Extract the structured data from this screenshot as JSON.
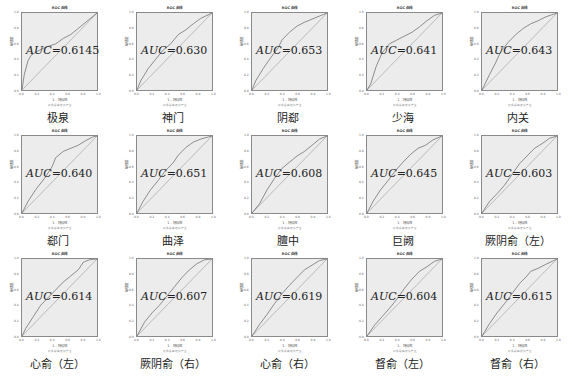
{
  "figure": {
    "chart_title": "ROC 曲线",
    "xlabel": "1 - 特异性",
    "ylabel": "敏感度",
    "note": "对角段由结值产生",
    "ticks": [
      "0.0",
      "0.2",
      "0.4",
      "0.6",
      "0.8",
      "1.0"
    ],
    "auc_prefix": "AUC",
    "auc_eq": "=",
    "line_color": "#6e6e6e",
    "bg_color": "#ececec"
  },
  "chart_data": [
    {
      "type": "line",
      "title": "ROC 曲线",
      "caption": "极泉",
      "auc": "0.6145",
      "xlabel": "1 - 特异性",
      "ylabel": "敏感度",
      "xlim": [
        0,
        1
      ],
      "ylim": [
        0,
        1
      ],
      "series": [
        {
          "name": "ROC",
          "x": [
            0,
            0.03,
            0.08,
            0.12,
            0.2,
            0.3,
            0.45,
            0.55,
            0.65,
            0.75,
            0.85,
            0.95,
            1
          ],
          "y": [
            0,
            0.2,
            0.38,
            0.45,
            0.5,
            0.55,
            0.6,
            0.67,
            0.72,
            0.8,
            0.88,
            0.96,
            1
          ]
        },
        {
          "name": "Reference",
          "x": [
            0,
            1
          ],
          "y": [
            0,
            1
          ]
        }
      ]
    },
    {
      "type": "line",
      "title": "ROC 曲线",
      "caption": "神门",
      "auc": "0.630",
      "xlabel": "1 - 特异性",
      "ylabel": "敏感度",
      "xlim": [
        0,
        1
      ],
      "ylim": [
        0,
        1
      ],
      "series": [
        {
          "name": "ROC",
          "x": [
            0,
            0.05,
            0.15,
            0.25,
            0.35,
            0.45,
            0.55,
            0.65,
            0.75,
            0.85,
            1
          ],
          "y": [
            0,
            0.12,
            0.28,
            0.4,
            0.52,
            0.6,
            0.72,
            0.78,
            0.86,
            0.93,
            1
          ]
        },
        {
          "name": "Reference",
          "x": [
            0,
            1
          ],
          "y": [
            0,
            1
          ]
        }
      ]
    },
    {
      "type": "line",
      "title": "ROC 曲线",
      "caption": "阴郄",
      "auc": "0.653",
      "xlabel": "1 - 特异性",
      "ylabel": "敏感度",
      "xlim": [
        0,
        1
      ],
      "ylim": [
        0,
        1
      ],
      "series": [
        {
          "name": "ROC",
          "x": [
            0,
            0.05,
            0.15,
            0.25,
            0.35,
            0.4,
            0.5,
            0.6,
            0.7,
            0.8,
            0.9,
            1
          ],
          "y": [
            0,
            0.12,
            0.28,
            0.42,
            0.55,
            0.65,
            0.75,
            0.83,
            0.88,
            0.92,
            0.96,
            1
          ]
        },
        {
          "name": "Reference",
          "x": [
            0,
            1
          ],
          "y": [
            0,
            1
          ]
        }
      ]
    },
    {
      "type": "line",
      "title": "ROC 曲线",
      "caption": "少海",
      "auc": "0.641",
      "xlabel": "1 - 特异性",
      "ylabel": "敏感度",
      "xlim": [
        0,
        1
      ],
      "ylim": [
        0,
        1
      ],
      "series": [
        {
          "name": "ROC",
          "x": [
            0,
            0.05,
            0.12,
            0.2,
            0.3,
            0.4,
            0.5,
            0.6,
            0.7,
            0.8,
            0.9,
            1
          ],
          "y": [
            0,
            0.08,
            0.3,
            0.48,
            0.6,
            0.65,
            0.7,
            0.75,
            0.82,
            0.9,
            0.97,
            1
          ]
        },
        {
          "name": "Reference",
          "x": [
            0,
            1
          ],
          "y": [
            0,
            1
          ]
        }
      ]
    },
    {
      "type": "line",
      "title": "ROC 曲线",
      "caption": "内关",
      "auc": "0.643",
      "xlabel": "1 - 特异性",
      "ylabel": "敏感度",
      "xlim": [
        0,
        1
      ],
      "ylim": [
        0,
        1
      ],
      "series": [
        {
          "name": "ROC",
          "x": [
            0,
            0.1,
            0.18,
            0.25,
            0.35,
            0.45,
            0.55,
            0.65,
            0.75,
            0.85,
            1
          ],
          "y": [
            0,
            0.2,
            0.35,
            0.5,
            0.62,
            0.72,
            0.8,
            0.86,
            0.9,
            0.95,
            1
          ]
        },
        {
          "name": "Reference",
          "x": [
            0,
            1
          ],
          "y": [
            0,
            1
          ]
        }
      ]
    },
    {
      "type": "line",
      "title": "ROC 曲线",
      "caption": "郄门",
      "auc": "0.640",
      "xlabel": "1 - 特异性",
      "ylabel": "敏感度",
      "xlim": [
        0,
        1
      ],
      "ylim": [
        0,
        1
      ],
      "series": [
        {
          "name": "ROC",
          "x": [
            0,
            0.08,
            0.18,
            0.3,
            0.4,
            0.45,
            0.55,
            0.65,
            0.75,
            0.85,
            0.95,
            1
          ],
          "y": [
            0,
            0.15,
            0.3,
            0.45,
            0.6,
            0.72,
            0.8,
            0.84,
            0.88,
            0.94,
            0.99,
            1
          ]
        },
        {
          "name": "Reference",
          "x": [
            0,
            1
          ],
          "y": [
            0,
            1
          ]
        }
      ]
    },
    {
      "type": "line",
      "title": "ROC 曲线",
      "caption": "曲泽",
      "auc": "0.651",
      "xlabel": "1 - 特异性",
      "ylabel": "敏感度",
      "xlim": [
        0,
        1
      ],
      "ylim": [
        0,
        1
      ],
      "series": [
        {
          "name": "ROC",
          "x": [
            0,
            0.08,
            0.18,
            0.28,
            0.38,
            0.48,
            0.55,
            0.65,
            0.75,
            0.85,
            1
          ],
          "y": [
            0,
            0.15,
            0.3,
            0.42,
            0.55,
            0.65,
            0.75,
            0.85,
            0.92,
            0.96,
            1
          ]
        },
        {
          "name": "Reference",
          "x": [
            0,
            1
          ],
          "y": [
            0,
            1
          ]
        }
      ]
    },
    {
      "type": "line",
      "title": "ROC 曲线",
      "caption": "膻中",
      "auc": "0.608",
      "xlabel": "1 - 特异性",
      "ylabel": "敏感度",
      "xlim": [
        0,
        1
      ],
      "ylim": [
        0,
        1
      ],
      "series": [
        {
          "name": "ROC",
          "x": [
            0,
            0.1,
            0.2,
            0.3,
            0.4,
            0.5,
            0.6,
            0.7,
            0.8,
            0.9,
            1
          ],
          "y": [
            0,
            0.12,
            0.3,
            0.45,
            0.58,
            0.66,
            0.74,
            0.8,
            0.88,
            0.96,
            1
          ]
        },
        {
          "name": "Reference",
          "x": [
            0,
            1
          ],
          "y": [
            0,
            1
          ]
        }
      ]
    },
    {
      "type": "line",
      "title": "ROC 曲线",
      "caption": "巨阙",
      "auc": "0.645",
      "xlabel": "1 - 特异性",
      "ylabel": "敏感度",
      "xlim": [
        0,
        1
      ],
      "ylim": [
        0,
        1
      ],
      "series": [
        {
          "name": "ROC",
          "x": [
            0,
            0.08,
            0.18,
            0.28,
            0.38,
            0.48,
            0.58,
            0.68,
            0.78,
            0.88,
            1
          ],
          "y": [
            0,
            0.15,
            0.3,
            0.42,
            0.55,
            0.66,
            0.76,
            0.84,
            0.88,
            0.95,
            1
          ]
        },
        {
          "name": "Reference",
          "x": [
            0,
            1
          ],
          "y": [
            0,
            1
          ]
        }
      ]
    },
    {
      "type": "line",
      "title": "ROC 曲线",
      "caption": "厥阴俞（左）",
      "auc": "0.603",
      "xlabel": "1 - 特异性",
      "ylabel": "敏感度",
      "xlim": [
        0,
        1
      ],
      "ylim": [
        0,
        1
      ],
      "series": [
        {
          "name": "ROC",
          "x": [
            0,
            0.1,
            0.2,
            0.3,
            0.4,
            0.5,
            0.6,
            0.7,
            0.8,
            0.9,
            1
          ],
          "y": [
            0,
            0.15,
            0.25,
            0.36,
            0.5,
            0.64,
            0.74,
            0.84,
            0.9,
            0.97,
            1
          ]
        },
        {
          "name": "Reference",
          "x": [
            0,
            1
          ],
          "y": [
            0,
            1
          ]
        }
      ]
    },
    {
      "type": "line",
      "title": "ROC 曲线",
      "caption": "心俞（左）",
      "auc": "0.614",
      "xlabel": "1 - 特异性",
      "ylabel": "敏感度",
      "xlim": [
        0,
        1
      ],
      "ylim": [
        0,
        1
      ],
      "series": [
        {
          "name": "ROC",
          "x": [
            0,
            0.05,
            0.15,
            0.25,
            0.35,
            0.45,
            0.55,
            0.65,
            0.75,
            0.82,
            0.9,
            1
          ],
          "y": [
            0,
            0.1,
            0.25,
            0.4,
            0.5,
            0.6,
            0.7,
            0.78,
            0.86,
            0.96,
            0.99,
            1
          ]
        },
        {
          "name": "Reference",
          "x": [
            0,
            1
          ],
          "y": [
            0,
            1
          ]
        }
      ]
    },
    {
      "type": "line",
      "title": "ROC 曲线",
      "caption": "厥阴俞（右）",
      "auc": "0.607",
      "xlabel": "1 - 特异性",
      "ylabel": "敏感度",
      "xlim": [
        0,
        1
      ],
      "ylim": [
        0,
        1
      ],
      "series": [
        {
          "name": "ROC",
          "x": [
            0,
            0.1,
            0.2,
            0.3,
            0.4,
            0.5,
            0.6,
            0.7,
            0.8,
            0.9,
            1
          ],
          "y": [
            0,
            0.18,
            0.3,
            0.4,
            0.52,
            0.64,
            0.76,
            0.86,
            0.94,
            0.99,
            1
          ]
        },
        {
          "name": "Reference",
          "x": [
            0,
            1
          ],
          "y": [
            0,
            1
          ]
        }
      ]
    },
    {
      "type": "line",
      "title": "ROC 曲线",
      "caption": "心俞（右）",
      "auc": "0.619",
      "xlabel": "1 - 特异性",
      "ylabel": "敏感度",
      "xlim": [
        0,
        1
      ],
      "ylim": [
        0,
        1
      ],
      "series": [
        {
          "name": "ROC",
          "x": [
            0,
            0.1,
            0.2,
            0.3,
            0.4,
            0.5,
            0.6,
            0.7,
            0.8,
            0.9,
            1
          ],
          "y": [
            0,
            0.15,
            0.28,
            0.42,
            0.55,
            0.66,
            0.76,
            0.86,
            0.92,
            0.98,
            1
          ]
        },
        {
          "name": "Reference",
          "x": [
            0,
            1
          ],
          "y": [
            0,
            1
          ]
        }
      ]
    },
    {
      "type": "line",
      "title": "ROC 曲线",
      "caption": "督俞（左）",
      "auc": "0.604",
      "xlabel": "1 - 特异性",
      "ylabel": "敏感度",
      "xlim": [
        0,
        1
      ],
      "ylim": [
        0,
        1
      ],
      "series": [
        {
          "name": "ROC",
          "x": [
            0,
            0.1,
            0.2,
            0.3,
            0.4,
            0.5,
            0.6,
            0.7,
            0.8,
            0.9,
            1
          ],
          "y": [
            0,
            0.14,
            0.25,
            0.36,
            0.48,
            0.62,
            0.74,
            0.84,
            0.9,
            0.97,
            1
          ]
        },
        {
          "name": "Reference",
          "x": [
            0,
            1
          ],
          "y": [
            0,
            1
          ]
        }
      ]
    },
    {
      "type": "line",
      "title": "ROC 曲线",
      "caption": "督俞（右）",
      "auc": "0.615",
      "xlabel": "1 - 特异性",
      "ylabel": "敏感度",
      "xlim": [
        0,
        1
      ],
      "ylim": [
        0,
        1
      ],
      "series": [
        {
          "name": "ROC",
          "x": [
            0,
            0.1,
            0.2,
            0.3,
            0.4,
            0.5,
            0.6,
            0.65,
            0.75,
            0.85,
            1
          ],
          "y": [
            0,
            0.16,
            0.3,
            0.42,
            0.55,
            0.68,
            0.78,
            0.84,
            0.88,
            0.93,
            1
          ]
        },
        {
          "name": "Reference",
          "x": [
            0,
            1
          ],
          "y": [
            0,
            1
          ]
        }
      ]
    }
  ]
}
